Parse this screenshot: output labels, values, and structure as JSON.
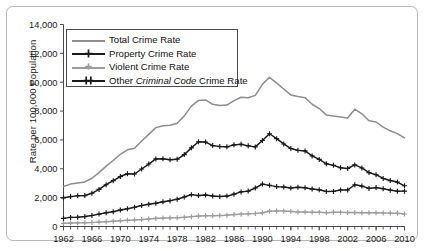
{
  "chart_data": {
    "type": "line",
    "title": "",
    "xlabel": "",
    "ylabel": "Rate per 100,000 Population",
    "xlim": [
      1962,
      2010
    ],
    "ylim": [
      0,
      14000
    ],
    "ytick_labels": [
      "0",
      "2,000",
      "4,000",
      "6,000",
      "8,000",
      "10,000",
      "12,000",
      "14,000"
    ],
    "ytick_values": [
      0,
      2000,
      4000,
      6000,
      8000,
      10000,
      12000,
      14000
    ],
    "xtick_labels": [
      "1962",
      "1966",
      "1970",
      "1974",
      "1978",
      "1982",
      "1986",
      "1990",
      "1994",
      "1998",
      "2002",
      "2006",
      "2010"
    ],
    "xtick_values": [
      1962,
      1966,
      1970,
      1974,
      1978,
      1982,
      1986,
      1990,
      1994,
      1998,
      2002,
      2006,
      2010
    ],
    "minor_xticks_every": 1,
    "grid": false,
    "legend_position": "upper-left-inside",
    "x": [
      1962,
      1963,
      1964,
      1965,
      1966,
      1967,
      1968,
      1969,
      1970,
      1971,
      1972,
      1973,
      1974,
      1975,
      1976,
      1977,
      1978,
      1979,
      1980,
      1981,
      1982,
      1983,
      1984,
      1985,
      1986,
      1987,
      1988,
      1989,
      1990,
      1991,
      1992,
      1993,
      1994,
      1995,
      1996,
      1997,
      1998,
      1999,
      2000,
      2001,
      2002,
      2003,
      2004,
      2005,
      2006,
      2007,
      2008,
      2009,
      2010
    ],
    "series": [
      {
        "name": "Total Crime Rate",
        "color": "#8d8d8d",
        "marker": "none",
        "values": [
          2771,
          2938,
          3021,
          3092,
          3342,
          3738,
          4181,
          4573,
          5003,
          5313,
          5425,
          5925,
          6388,
          6852,
          6984,
          7013,
          7154,
          7666,
          8343,
          8736,
          8773,
          8470,
          8387,
          8413,
          8726,
          8959,
          8919,
          9088,
          9850,
          10342,
          9936,
          9529,
          9117,
          9006,
          8929,
          8473,
          8175,
          7733,
          7655,
          7590,
          7514,
          8132,
          7813,
          7325,
          7243,
          6885,
          6631,
          6439,
          6143
        ]
      },
      {
        "name": "Property Crime Rate",
        "color": "#1a1a1a",
        "marker": "plus",
        "values": [
          1987,
          2071,
          2129,
          2145,
          2302,
          2573,
          2895,
          3176,
          3462,
          3654,
          3640,
          3986,
          4329,
          4684,
          4689,
          4626,
          4658,
          4983,
          5451,
          5869,
          5850,
          5607,
          5546,
          5520,
          5659,
          5704,
          5589,
          5517,
          5963,
          6428,
          6089,
          5721,
          5404,
          5278,
          5237,
          4894,
          4649,
          4345,
          4237,
          4076,
          4021,
          4270,
          4058,
          3738,
          3588,
          3328,
          3183,
          3079,
          2822
        ]
      },
      {
        "name": "Violent Crime Rate",
        "color": "#9d9d9d",
        "marker": "plus",
        "values": [
          221,
          236,
          250,
          258,
          277,
          305,
          334,
          369,
          401,
          429,
          452,
          481,
          521,
          561,
          584,
          596,
          611,
          636,
          684,
          724,
          745,
          748,
          763,
          785,
          827,
          856,
          877,
          903,
          948,
          1061,
          1082,
          1074,
          1046,
          1006,
          1002,
          986,
          984,
          959,
          984,
          984,
          966,
          966,
          953,
          947,
          958,
          939,
          928,
          919,
          870
        ]
      },
      {
        "name": "Other Criminal Code Crime Rate",
        "color": "#1a1a1a",
        "marker": "plus",
        "values": [
          563,
          631,
          642,
          689,
          763,
          860,
          952,
          1028,
          1140,
          1230,
          1333,
          1458,
          1538,
          1607,
          1711,
          1791,
          1885,
          2047,
          2208,
          2143,
          2178,
          2115,
          2078,
          2108,
          2240,
          2399,
          2453,
          2668,
          2939,
          2853,
          2765,
          2734,
          2667,
          2722,
          2690,
          2593,
          2542,
          2429,
          2434,
          2530,
          2527,
          2896,
          2802,
          2640,
          2697,
          2618,
          2520,
          2441,
          2451
        ]
      }
    ]
  },
  "legend": {
    "items": [
      {
        "label_pre": "Total Crime Rate",
        "label_em": "",
        "label_post": ""
      },
      {
        "label_pre": "Property Crime Rate",
        "label_em": "",
        "label_post": ""
      },
      {
        "label_pre": "Violent Crime Rate",
        "label_em": "",
        "label_post": ""
      },
      {
        "label_pre": "Other ",
        "label_em": "Criminal Code",
        "label_post": " Crime Rate"
      }
    ]
  }
}
